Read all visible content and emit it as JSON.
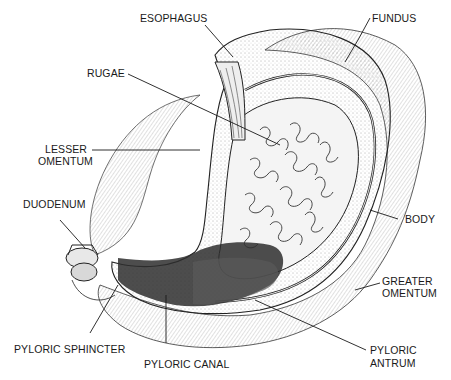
{
  "diagram": {
    "labels": {
      "esophagus": "ESOPHAGUS",
      "fundus": "FUNDUS",
      "rugae": "RUGAE",
      "lesser_omentum_1": "LESSER",
      "lesser_omentum_2": "OMENTUM",
      "duodenum": "DUODENUM",
      "body": "BODY",
      "greater_omentum_1": "GREATER",
      "greater_omentum_2": "OMENTUM",
      "pyloric_sphincter": "PYLORIC SPHINCTER",
      "pyloric_canal": "PYLORIC CANAL",
      "pyloric_antrum_1": "PYLORIC",
      "pyloric_antrum_2": "ANTRUM"
    },
    "colors": {
      "ink": "#1a1a1a",
      "shaded_region": "#3a3a3a",
      "background": "#ffffff"
    }
  }
}
